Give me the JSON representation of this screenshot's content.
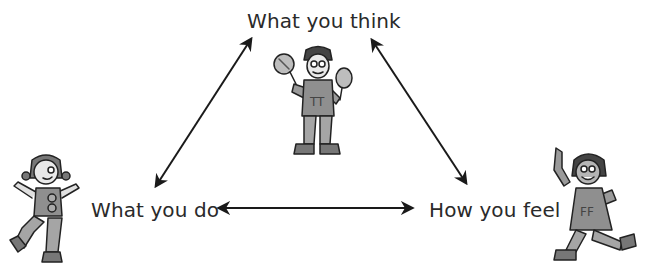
{
  "diagram": {
    "type": "cycle-triangle",
    "nodes": [
      {
        "id": "think",
        "label": "What you think",
        "position": "top"
      },
      {
        "id": "do",
        "label": "What you do",
        "position": "bottom-left"
      },
      {
        "id": "feel",
        "label": "How you feel",
        "position": "bottom-right"
      }
    ],
    "edges": [
      {
        "from": "do",
        "to": "think",
        "direction": "bidirectional"
      },
      {
        "from": "think",
        "to": "feel",
        "direction": "bidirectional"
      },
      {
        "from": "do",
        "to": "feel",
        "direction": "bidirectional"
      }
    ],
    "illustrations": [
      {
        "id": "thinker-character",
        "position": "top-center",
        "shirt_letters": "TT",
        "holding": "two round lollipops/rattles"
      },
      {
        "id": "doer-character",
        "position": "bottom-left",
        "shirt_letters": "GG",
        "pose": "dancing"
      },
      {
        "id": "feeler-character",
        "position": "bottom-right",
        "shirt_letters": "FF",
        "pose": "walking/dancing"
      }
    ],
    "colors": {
      "background": "#ffffff",
      "text": "#2a2a2a",
      "arrows": "#1a1a1a",
      "figure_fill": "#9a9a9a",
      "figure_outline": "#222222"
    }
  }
}
